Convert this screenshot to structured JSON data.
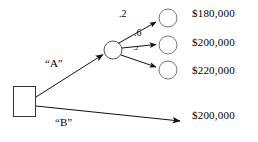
{
  "diagram": {
    "type": "decision-tree",
    "background_color": "#ffffff",
    "line_color": "#1a1a1a",
    "node_fill": "#ffffff"
  },
  "decision_node": {
    "name": "decision-square",
    "shape": "square",
    "x": 13,
    "y": 86,
    "width": 23,
    "height": 31
  },
  "chance_node": {
    "name": "chance-circle",
    "shape": "circle",
    "cx": 113,
    "cy": 50,
    "r": 9
  },
  "branches": [
    {
      "id": "A",
      "label": "“A”",
      "label_x": 45,
      "label_y": 63,
      "from": [
        36,
        97
      ],
      "to": [
        104,
        54
      ]
    },
    {
      "id": "B",
      "label": "“B”",
      "label_x": 55,
      "label_y": 122,
      "from": [
        36,
        106
      ],
      "to": [
        181,
        121
      ],
      "payoff": "$200,000"
    }
  ],
  "chance_branches": [
    {
      "probability": ".2",
      "prob_x": 119,
      "prob_y": 12,
      "prob_size": "normal",
      "from": [
        118,
        43
      ],
      "to": [
        158,
        21
      ],
      "terminal": {
        "cx": 168,
        "cy": 18,
        "r": 9
      },
      "payoff": "$180,000"
    },
    {
      "probability": ".6",
      "prob_x": 134,
      "prob_y": 31,
      "prob_size": "normal",
      "from": [
        122,
        48
      ],
      "to": [
        158,
        45
      ],
      "terminal": {
        "cx": 168,
        "cy": 45,
        "r": 9
      },
      "payoff": "$200,000"
    },
    {
      "probability": ".2",
      "prob_x": 133,
      "prob_y": 46,
      "prob_size": "tiny",
      "from": [
        121,
        55
      ],
      "to": [
        158,
        68
      ],
      "terminal": {
        "cx": 168,
        "cy": 70,
        "r": 9
      },
      "payoff": "$220,000"
    }
  ],
  "payoffs": [
    {
      "text": "$180,000",
      "x": 192,
      "y": 9
    },
    {
      "text": "$200,000",
      "x": 192,
      "y": 38
    },
    {
      "text": "$220,000",
      "x": 192,
      "y": 66
    },
    {
      "text": "$200,000",
      "x": 192,
      "y": 111
    }
  ]
}
